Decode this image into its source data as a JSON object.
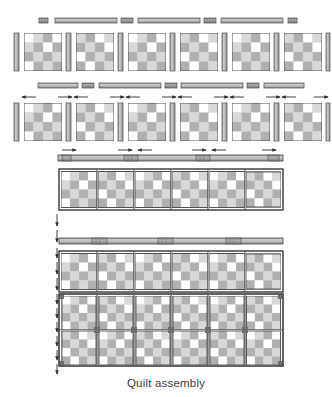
{
  "figure": {
    "caption": "Quilt assembly",
    "type": "quilt-assembly-diagram",
    "background": "#ffffff"
  },
  "palette": {
    "fabric_light": "#ffffff",
    "fabric_pale_gray": "#d8d8d8",
    "fabric_medium_gray": "#b0b0b0",
    "sashing_gray": "#a8a8a8",
    "sashing_light": "#cfcfcf",
    "cornerstone_gray": "#9a9a9a",
    "outline": "#4a4a4a",
    "arrow": "#2b2b2b",
    "caption_color": "#3a3a3a"
  },
  "geometry": {
    "canvas_width": 332,
    "canvas_height": 397,
    "block_grid": 4,
    "blocks_per_row": 6,
    "rows_in_quilt": 2
  },
  "block_pattern": {
    "description": "4x4 patch block, nine-patch style with pale and medium gray squares",
    "cells": [
      [
        "light",
        "medium",
        "medium",
        "light"
      ],
      [
        "medium",
        "pale",
        "pale",
        "medium"
      ],
      [
        "medium",
        "pale",
        "pale",
        "medium"
      ],
      [
        "light",
        "medium",
        "medium",
        "light"
      ]
    ],
    "variant_cells": [
      [
        "pale",
        "medium",
        "light",
        "light"
      ],
      [
        "medium",
        "pale",
        "medium",
        "pale"
      ],
      [
        "light",
        "medium",
        "pale",
        "medium"
      ],
      [
        "medium",
        "light",
        "medium",
        "light"
      ]
    ]
  },
  "steps": [
    {
      "id": "step-1-sashing-row",
      "name": "top-sashing-strip-row",
      "description": "Alternating cornerstones and long sashing strips laid out in a row",
      "cornerstone_count": 4,
      "sashing_count": 3
    },
    {
      "id": "step-2-block-row",
      "name": "blocks-with-vertical-sashing-row",
      "description": "Six blocks separated by seven vertical sashing strips",
      "block_count": 6,
      "vertical_sashing_count": 7
    },
    {
      "id": "step-3-sashing-row-2",
      "name": "second-sashing-strip-row",
      "description": "Second set of cornerstones and sashing strips",
      "cornerstone_count": 4,
      "sashing_count": 3
    },
    {
      "id": "step-4-block-row-arrows",
      "name": "block-row-with-seam-arrows",
      "description": "Six blocks joined to vertical sashing, arrows show pressing direction",
      "block_count": 6,
      "arrow_count": 12
    },
    {
      "id": "step-5-joined-row",
      "name": "assembled-block-row-one",
      "description": "First completed block row with sashing sewn on",
      "block_count": 6
    },
    {
      "id": "step-6-horizontal-sashing",
      "name": "horizontal-sashing-strip",
      "description": "Long pieced sashing strip with cornerstones joining rows"
    },
    {
      "id": "step-7-joined-row-2",
      "name": "assembled-block-row-two",
      "description": "Second completed block row",
      "block_count": 6
    },
    {
      "id": "step-8-full-quilt",
      "name": "full-quilt-top",
      "description": "Two block rows joined into the finished quilt top",
      "block_count": 12,
      "rows": 2,
      "columns": 6
    }
  ],
  "arrows": {
    "top_row_label": "pressing-direction-arrows",
    "left_column_label": "assembly-direction-arrows",
    "count_top": 12,
    "count_left": 14
  }
}
